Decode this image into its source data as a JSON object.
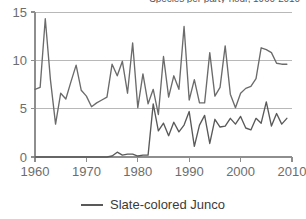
{
  "chart_data": {
    "type": "line",
    "title": "Species per party-hour, 1960-2010",
    "title_note": "title is cropped at the top edge of the screenshot",
    "xlabel": "",
    "ylabel": "",
    "xlim": [
      1960,
      2010
    ],
    "ylim": [
      0,
      15
    ],
    "grid": true,
    "gridlines_y": [
      0,
      5,
      10,
      15
    ],
    "xticks": [
      1960,
      1970,
      1980,
      1990,
      2000,
      2010
    ],
    "xtick_labels": [
      "1960",
      "1970",
      "1980",
      "1990",
      "2000",
      "2010"
    ],
    "yticks": [
      0,
      5,
      10,
      15
    ],
    "ytick_labels": [
      "0",
      "5",
      "10",
      "15"
    ],
    "legend_position": "bottom-center",
    "legend": [
      "Slate-colored Junco"
    ],
    "x": [
      1960,
      1961,
      1962,
      1963,
      1964,
      1965,
      1966,
      1967,
      1968,
      1969,
      1970,
      1971,
      1972,
      1973,
      1974,
      1975,
      1976,
      1977,
      1978,
      1979,
      1980,
      1981,
      1982,
      1983,
      1984,
      1985,
      1986,
      1987,
      1988,
      1989,
      1990,
      1991,
      1992,
      1993,
      1994,
      1995,
      1996,
      1997,
      1998,
      1999,
      2000,
      2001,
      2002,
      2003,
      2004,
      2005,
      2006,
      2007,
      2008,
      2009
    ],
    "series": [
      {
        "name": "upper-series",
        "color": "#6b6b6b",
        "values": [
          7.0,
          7.2,
          14.3,
          8.0,
          3.4,
          6.6,
          6.0,
          7.8,
          9.5,
          6.9,
          6.3,
          5.2,
          5.6,
          5.9,
          6.2,
          9.6,
          8.4,
          9.9,
          6.6,
          11.8,
          5.1,
          8.6,
          5.5,
          7.0,
          4.4,
          10.4,
          6.2,
          8.4,
          7.0,
          13.5,
          5.9,
          8.0,
          5.6,
          5.6,
          10.8,
          6.3,
          7.2,
          11.5,
          6.5,
          5.1,
          6.6,
          7.1,
          7.3,
          8.1,
          11.3,
          11.1,
          10.8,
          9.7,
          9.6,
          9.6
        ]
      },
      {
        "name": "Slate-colored Junco",
        "color": "#595959",
        "values": [
          0.0,
          0.0,
          0.0,
          0.0,
          0.0,
          0.0,
          0.0,
          0.0,
          0.0,
          0.0,
          0.0,
          0.0,
          0.0,
          0.0,
          0.0,
          0.1,
          0.5,
          0.2,
          0.3,
          0.3,
          0.1,
          0.2,
          0.2,
          5.5,
          2.7,
          3.5,
          2.2,
          3.6,
          2.6,
          3.3,
          4.7,
          1.1,
          3.3,
          4.3,
          1.4,
          3.9,
          3.1,
          3.2,
          4.0,
          3.4,
          4.2,
          3.0,
          2.8,
          4.0,
          3.5,
          5.7,
          3.2,
          4.5,
          3.4,
          4.0
        ]
      }
    ]
  }
}
